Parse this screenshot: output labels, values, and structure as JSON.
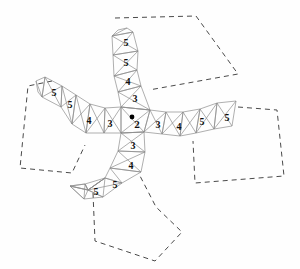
{
  "figure": {
    "title_faint": "",
    "background_color": "#fefefe",
    "mesh_line_color": "#8d8d8d",
    "dashed_line_color": "#4a4a4a",
    "label_color": "#101010",
    "center_dot_color": "#000000",
    "center_dot": {
      "x": 132,
      "y": 117,
      "r": 2.4
    }
  },
  "labels": {
    "center": {
      "text": "2",
      "x": 137,
      "y": 124,
      "size": 11
    },
    "arm_up": [
      {
        "text": "3",
        "x": 135,
        "y": 98,
        "size": 10
      },
      {
        "text": "4",
        "x": 128,
        "y": 81,
        "size": 10
      },
      {
        "text": "5",
        "x": 126,
        "y": 62,
        "size": 10
      },
      {
        "text": "5",
        "x": 126,
        "y": 42,
        "size": 10
      }
    ],
    "arm_down": [
      {
        "text": "3",
        "x": 133,
        "y": 145,
        "size": 10
      },
      {
        "text": "4",
        "x": 131,
        "y": 165,
        "size": 10
      },
      {
        "text": "5",
        "x": 115,
        "y": 184,
        "size": 10
      },
      {
        "text": "5",
        "x": 96,
        "y": 191,
        "size": 10
      }
    ],
    "arm_left": [
      {
        "text": "3",
        "x": 110,
        "y": 123,
        "size": 10
      },
      {
        "text": "4",
        "x": 89,
        "y": 120,
        "size": 10
      },
      {
        "text": "5",
        "x": 70,
        "y": 104,
        "size": 10
      },
      {
        "text": "5",
        "x": 54,
        "y": 92,
        "size": 10
      }
    ],
    "arm_right": [
      {
        "text": "3",
        "x": 158,
        "y": 124,
        "size": 10
      },
      {
        "text": "4",
        "x": 179,
        "y": 126,
        "size": 10
      },
      {
        "text": "5",
        "x": 202,
        "y": 121,
        "size": 10
      },
      {
        "text": "5",
        "x": 227,
        "y": 117,
        "size": 10
      }
    ]
  },
  "mesh_nodes": {
    "center_hub": [
      132,
      109
    ],
    "description": "cross-shaped strip of quadrilateral cells, each split by two diagonals"
  },
  "mesh_strips": {
    "arm_up": {
      "left_rail": [
        [
          121,
          120
        ],
        [
          118,
          106
        ],
        [
          117,
          92
        ],
        [
          114,
          76
        ],
        [
          113,
          55
        ],
        [
          112,
          36
        ]
      ],
      "right_rail": [
        [
          150,
          110
        ],
        [
          141,
          101
        ],
        [
          140,
          86
        ],
        [
          137,
          70
        ],
        [
          138,
          51
        ],
        [
          133,
          32
        ]
      ]
    },
    "arm_down": {
      "left_rail": [
        [
          121,
          120
        ],
        [
          118,
          134
        ],
        [
          113,
          151
        ],
        [
          107,
          168
        ],
        [
          88,
          176
        ],
        [
          70,
          186
        ]
      ],
      "right_rail": [
        [
          143,
          121
        ],
        [
          145,
          136
        ],
        [
          144,
          154
        ],
        [
          140,
          172
        ],
        [
          122,
          183
        ],
        [
          103,
          197
        ]
      ]
    },
    "arm_left": {
      "top_rail": [
        [
          121,
          107
        ],
        [
          108,
          107
        ],
        [
          92,
          104
        ],
        [
          76,
          95
        ],
        [
          60,
          83
        ],
        [
          45,
          77
        ]
      ],
      "bottom_rail": [
        [
          121,
          133
        ],
        [
          104,
          133
        ],
        [
          86,
          133
        ],
        [
          72,
          124
        ],
        [
          61,
          107
        ],
        [
          42,
          97
        ]
      ]
    },
    "arm_right": {
      "top_rail": [
        [
          150,
          110
        ],
        [
          166,
          112
        ],
        [
          183,
          112
        ],
        [
          200,
          109
        ],
        [
          217,
          103
        ],
        [
          235,
          102
        ]
      ],
      "bottom_rail": [
        [
          144,
          132
        ],
        [
          162,
          134
        ],
        [
          180,
          136
        ],
        [
          196,
          133
        ],
        [
          214,
          129
        ],
        [
          232,
          126
        ]
      ]
    }
  },
  "dashed_regions": [
    {
      "name": "top-right-region",
      "points": "115,18 196,16 238,74 149,90 127,54"
    },
    {
      "name": "left-region",
      "points": "28,86 52,81 73,112 85,145 72,173 20,168"
    },
    {
      "name": "right-region",
      "points": "193,141 238,107 277,110 284,176 195,183"
    },
    {
      "name": "bottom-region",
      "points": "93,193 139,174 156,207 182,232 155,261 95,241"
    }
  ],
  "legend": {
    "note": "numeric labels indicate cell valence / step count"
  }
}
